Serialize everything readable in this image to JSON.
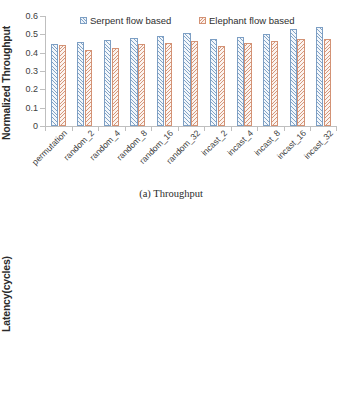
{
  "figure": {
    "panels": [
      {
        "id": "throughput",
        "caption": "(a) Throughput",
        "ylabel": "Normalized Throughput"
      },
      {
        "id": "latency",
        "caption": "(b) Latency",
        "ylabel": "Latency(cycles)"
      }
    ]
  },
  "legend": {
    "serpent": "Serpent flow based",
    "elephant": "Elephant flow based",
    "serpent_color": "#7d9fc4",
    "elephant_color": "#d39275"
  },
  "chart_data": [
    {
      "type": "bar",
      "id": "throughput",
      "title": "(a) Throughput",
      "xlabel": "",
      "ylabel": "Normalized Throughput",
      "ylim": [
        0,
        0.6
      ],
      "yticks": [
        "0",
        "0.1",
        "0.2",
        "0.3",
        "0.4",
        "0.5",
        "0.6"
      ],
      "ytick_values": [
        0,
        0.1,
        0.2,
        0.3,
        0.4,
        0.5,
        0.6
      ],
      "grid": false,
      "legend_position": "top-center",
      "categories": [
        "permutation",
        "random_2",
        "random_4",
        "random_8",
        "random_16",
        "random_32",
        "incast_2",
        "incast_4",
        "incast_8",
        "incast_16",
        "incast_32"
      ],
      "series": [
        {
          "name": "Serpent flow based",
          "color": "#7d9fc4",
          "values": [
            0.45,
            0.46,
            0.47,
            0.481,
            0.492,
            0.508,
            0.473,
            0.487,
            0.503,
            0.528,
            0.54
          ]
        },
        {
          "name": "Elephant flow based",
          "color": "#d39275",
          "values": [
            0.44,
            0.417,
            0.427,
            0.447,
            0.452,
            0.463,
            0.438,
            0.453,
            0.463,
            0.475,
            0.476
          ]
        }
      ]
    },
    {
      "type": "bar",
      "id": "latency",
      "title": "(b) Latency",
      "xlabel": "",
      "ylabel": "Latency(cycles)",
      "ylim": [
        0,
        80
      ],
      "yticks": [
        "0",
        "10",
        "20",
        "30",
        "40",
        "50",
        "60",
        "70",
        "80"
      ],
      "ytick_values": [
        0,
        10,
        20,
        30,
        40,
        50,
        60,
        70,
        80
      ],
      "grid": false,
      "legend_position": "top-center",
      "categories": [
        "permutation",
        "random_2",
        "random_4",
        "random_8",
        "random_16",
        "random_32",
        "incast_2",
        "incast_4",
        "incast_8",
        "incast_16",
        "incast_32"
      ],
      "series": [
        {
          "name": "Serpent flow based",
          "color": "#7d9fc4",
          "values": [
            70.5,
            49.0,
            59.5,
            54.0,
            46.5,
            43.0,
            53.0,
            48.5,
            44.5,
            40.0,
            37.5
          ]
        },
        {
          "name": "Elephant flow based",
          "color": "#d39275",
          "values": [
            75.5,
            60.5,
            71.0,
            65.5,
            54.5,
            50.0,
            62.0,
            57.5,
            52.5,
            48.0,
            45.5
          ]
        }
      ]
    }
  ]
}
